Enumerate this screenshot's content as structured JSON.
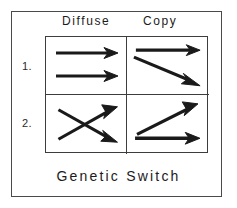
{
  "figure": {
    "caption": "Genetic Switch",
    "frame_color": "#4a4a4a",
    "grid_color": "#3d3d3d",
    "arrow_color": "#1a1a1a",
    "background": "#ffffff"
  },
  "columns": [
    {
      "id": "diffuse",
      "label": "Diffuse"
    },
    {
      "id": "copy",
      "label": "Copy"
    }
  ],
  "rows": [
    {
      "id": "row-1",
      "label": "1."
    },
    {
      "id": "row-2",
      "label": "2."
    }
  ],
  "cells": {
    "row1_diffuse": {
      "name": "cell-1-diffuse",
      "description": "two parallel horizontal right-pointing arrows",
      "arrows": [
        {
          "x1": 10,
          "y1": 16,
          "x2": 68,
          "y2": 16,
          "direction": "right"
        },
        {
          "x1": 10,
          "y1": 39,
          "x2": 68,
          "y2": 39,
          "direction": "right"
        }
      ]
    },
    "row1_copy": {
      "name": "cell-1-copy",
      "description": "horizontal right arrow above a downward-sloping right arrow",
      "arrows": [
        {
          "x1": 10,
          "y1": 13,
          "x2": 70,
          "y2": 13,
          "direction": "right"
        },
        {
          "x1": 8,
          "y1": 20,
          "x2": 70,
          "y2": 46,
          "direction": "down-right"
        }
      ]
    },
    "row2_diffuse": {
      "name": "cell-2-diffuse",
      "description": "two crossing arrows forming an X, one up-right and one down-right",
      "arrows": [
        {
          "x1": 13,
          "y1": 43,
          "x2": 68,
          "y2": 13,
          "direction": "up-right"
        },
        {
          "x1": 13,
          "y1": 13,
          "x2": 68,
          "y2": 43,
          "direction": "down-right"
        }
      ]
    },
    "row2_copy": {
      "name": "cell-2-copy",
      "description": "upward-sloping right arrow above a horizontal right arrow",
      "arrows": [
        {
          "x1": 11,
          "y1": 38,
          "x2": 66,
          "y2": 10,
          "direction": "up-right"
        },
        {
          "x1": 9,
          "y1": 42,
          "x2": 71,
          "y2": 42,
          "direction": "right"
        }
      ]
    }
  }
}
